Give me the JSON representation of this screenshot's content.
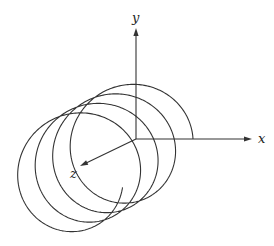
{
  "figure": {
    "type": "helix-3d-axes",
    "stroke_color": "#333333",
    "background": "#ffffff",
    "axes": {
      "origin": [
        136,
        139
      ],
      "x": {
        "label": "x",
        "end": [
          252,
          139
        ],
        "label_pos": [
          258,
          143
        ]
      },
      "y": {
        "label": "y",
        "end": [
          136,
          28
        ],
        "label_pos": [
          132,
          22
        ]
      },
      "z": {
        "label": "z",
        "end": [
          80,
          166
        ],
        "label_pos": [
          70,
          178
        ]
      }
    },
    "helix": {
      "center_start": [
        136,
        139
      ],
      "radius": 57,
      "shift_per_turn": [
        -17.5,
        9.5
      ],
      "turns": 3.97,
      "start_angle_deg": 0
    }
  }
}
